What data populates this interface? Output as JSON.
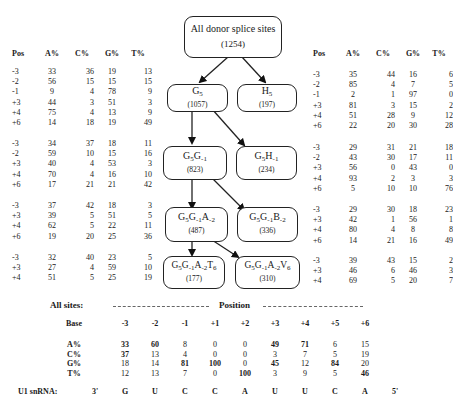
{
  "diagram": {
    "root": {
      "label": "All donor splice sites",
      "count": "(1254)"
    },
    "nodes": [
      {
        "id": "G5",
        "name": "G",
        "sub": "5",
        "count": "(1057)"
      },
      {
        "id": "H5",
        "name": "H",
        "sub": "5",
        "count": "(197)"
      },
      {
        "id": "G5G-1",
        "name": "G5G-1",
        "count": "(823)"
      },
      {
        "id": "G5H-1",
        "name": "G5H-1",
        "count": "(234)"
      },
      {
        "id": "G5G-1A-2",
        "name": "G5G-1A-2",
        "count": "(487)"
      },
      {
        "id": "G5G-1B-2",
        "name": "G5G-1B-2",
        "count": "(336)"
      },
      {
        "id": "G5G-1A-2T6",
        "name": "G5G-1A-2T6",
        "count": "(177)"
      },
      {
        "id": "G5G-1A-2V6",
        "name": "G5G-1A-2V6",
        "count": "(310)"
      }
    ],
    "edges": [
      [
        "root",
        "G5"
      ],
      [
        "root",
        "H5"
      ],
      [
        "G5",
        "G5G-1"
      ],
      [
        "G5",
        "G5H-1"
      ],
      [
        "G5G-1",
        "G5G-1A-2"
      ],
      [
        "G5G-1",
        "G5G-1B-2"
      ],
      [
        "G5G-1A-2",
        "G5G-1A-2T6"
      ],
      [
        "G5G-1A-2",
        "G5G-1A-2V6"
      ]
    ]
  },
  "left_tables": {
    "headers": [
      "Pos",
      "A%",
      "C%",
      "G%",
      "T%"
    ],
    "groups": [
      {
        "node": "G5",
        "rows": [
          [
            "-3",
            "33",
            "36",
            "19",
            "13"
          ],
          [
            "-2",
            "56",
            "15",
            "15",
            "15"
          ],
          [
            "-1",
            "9",
            "4",
            "78",
            "9"
          ],
          [
            "+3",
            "44",
            "3",
            "51",
            "3"
          ],
          [
            "+4",
            "75",
            "4",
            "13",
            "9"
          ],
          [
            "+6",
            "14",
            "18",
            "19",
            "49"
          ]
        ]
      },
      {
        "node": "G5G-1",
        "rows": [
          [
            "-3",
            "34",
            "37",
            "18",
            "11"
          ],
          [
            "-2",
            "59",
            "10",
            "15",
            "16"
          ],
          [
            "+3",
            "40",
            "4",
            "53",
            "3"
          ],
          [
            "+4",
            "70",
            "4",
            "16",
            "10"
          ],
          [
            "+6",
            "17",
            "21",
            "21",
            "42"
          ]
        ]
      },
      {
        "node": "G5G-1A-2",
        "rows": [
          [
            "-3",
            "37",
            "42",
            "18",
            "3"
          ],
          [
            "+3",
            "39",
            "5",
            "51",
            "5"
          ],
          [
            "+4",
            "62",
            "5",
            "22",
            "11"
          ],
          [
            "+6",
            "19",
            "20",
            "25",
            "36"
          ]
        ]
      },
      {
        "node": "G5G-1A-2T6",
        "rows": [
          [
            "-3",
            "32",
            "40",
            "23",
            "5"
          ],
          [
            "+3",
            "27",
            "4",
            "59",
            "10"
          ],
          [
            "+4",
            "51",
            "5",
            "25",
            "19"
          ]
        ]
      }
    ]
  },
  "right_tables": {
    "headers": [
      "Pos",
      "A%",
      "C%",
      "G%",
      "T%"
    ],
    "groups": [
      {
        "node": "H5",
        "rows": [
          [
            "-3",
            "35",
            "44",
            "16",
            "6"
          ],
          [
            "-2",
            "85",
            "4",
            "7",
            "5"
          ],
          [
            "-1",
            "2",
            "1",
            "97",
            "0"
          ],
          [
            "+3",
            "81",
            "3",
            "15",
            "2"
          ],
          [
            "+4",
            "51",
            "28",
            "9",
            "12"
          ],
          [
            "+6",
            "22",
            "20",
            "30",
            "28"
          ]
        ]
      },
      {
        "node": "G5H-1",
        "rows": [
          [
            "-3",
            "29",
            "31",
            "21",
            "18"
          ],
          [
            "-2",
            "43",
            "30",
            "17",
            "11"
          ],
          [
            "+3",
            "56",
            "0",
            "43",
            "0"
          ],
          [
            "+4",
            "93",
            "2",
            "3",
            "3"
          ],
          [
            "+6",
            "5",
            "10",
            "10",
            "76"
          ]
        ]
      },
      {
        "node": "G5G-1B-2",
        "rows": [
          [
            "-3",
            "29",
            "30",
            "18",
            "23"
          ],
          [
            "+3",
            "42",
            "1",
            "56",
            "1"
          ],
          [
            "+4",
            "80",
            "4",
            "8",
            "8"
          ],
          [
            "+6",
            "14",
            "21",
            "16",
            "49"
          ]
        ]
      },
      {
        "node": "G5G-1A-2V6",
        "rows": [
          [
            "-3",
            "39",
            "43",
            "15",
            "2"
          ],
          [
            "+3",
            "46",
            "6",
            "46",
            "3"
          ],
          [
            "+4",
            "69",
            "5",
            "20",
            "7"
          ]
        ]
      }
    ]
  },
  "all_sites": {
    "title": "All sites:",
    "position_label": "Position",
    "base_label": "Base",
    "positions": [
      "-3",
      "-2",
      "-1",
      "+1",
      "+2",
      "+3",
      "+4",
      "+5",
      "+6"
    ],
    "rows": [
      {
        "label": "A%",
        "values": [
          "33",
          "60",
          "8",
          "0",
          "0",
          "49",
          "71",
          "6",
          "15"
        ],
        "bold": [
          true,
          true,
          false,
          false,
          false,
          true,
          true,
          false,
          false
        ]
      },
      {
        "label": "C%",
        "values": [
          "37",
          "13",
          "4",
          "0",
          "0",
          "3",
          "7",
          "5",
          "19"
        ],
        "bold": [
          true,
          false,
          false,
          false,
          false,
          false,
          false,
          false,
          false
        ]
      },
      {
        "label": "G%",
        "values": [
          "18",
          "14",
          "81",
          "100",
          "0",
          "45",
          "12",
          "84",
          "20"
        ],
        "bold": [
          false,
          false,
          true,
          true,
          false,
          true,
          false,
          true,
          false
        ]
      },
      {
        "label": "T%",
        "values": [
          "12",
          "13",
          "7",
          "0",
          "100",
          "3",
          "9",
          "5",
          "46"
        ],
        "bold": [
          false,
          false,
          false,
          false,
          true,
          false,
          false,
          false,
          true
        ]
      }
    ],
    "u1": {
      "label": "U1 snRNA:",
      "start": "3'",
      "bases": [
        "G",
        "U",
        "C",
        "C",
        "A",
        "U",
        "U",
        "C",
        "A"
      ],
      "end": "5'"
    }
  }
}
